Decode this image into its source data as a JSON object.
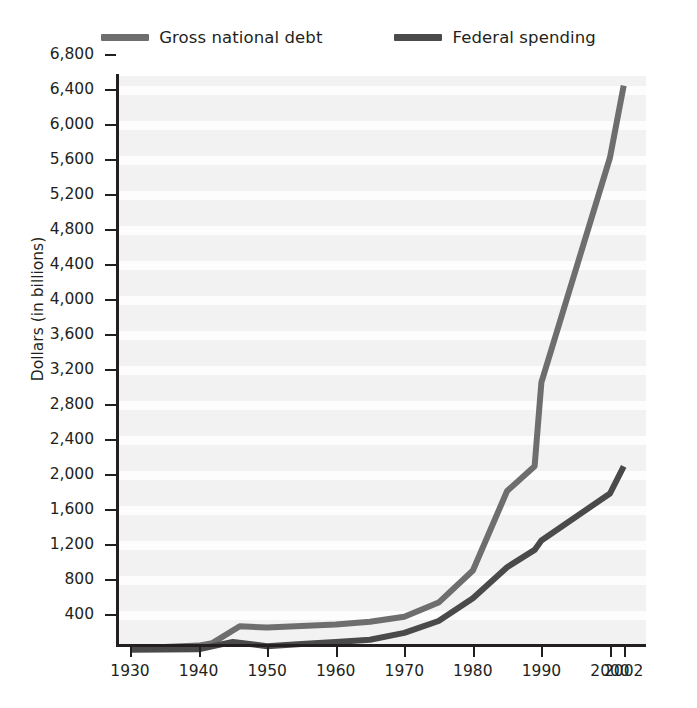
{
  "figure": {
    "background": "#ffffff",
    "plot_background": "#f2f2f2",
    "band_color": "#fdfdfd"
  },
  "legend": {
    "position": "top-center",
    "items": [
      {
        "label": "Gross national debt",
        "color": "#6e6e6e",
        "swatch": "line-swatch"
      },
      {
        "label": "Federal spending",
        "color": "#4a4a4a",
        "swatch": "line-swatch"
      }
    ]
  },
  "axes": {
    "ylabel": "Dollars (in billions)",
    "xlabel": "",
    "ytick_labels": [
      "6,800",
      "6,400",
      "6,000",
      "5,600",
      "5,200",
      "4,800",
      "4,400",
      "4,000",
      "3,600",
      "3,200",
      "2,800",
      "2,400",
      "2,000",
      "1,600",
      "1,200",
      "800",
      "400"
    ],
    "xtick_labels": [
      "1930",
      "1940",
      "1950",
      "1960",
      "1970",
      "1980",
      "1990",
      "2000",
      "2002"
    ]
  },
  "chart_data": {
    "type": "line",
    "title": "",
    "xlabel": "",
    "ylabel": "Dollars (in billions)",
    "xlim": [
      1930,
      2002
    ],
    "ylim": [
      0,
      6800
    ],
    "yticks": [
      400,
      800,
      1200,
      1600,
      2000,
      2400,
      2800,
      3200,
      3600,
      4000,
      4400,
      4800,
      5200,
      5600,
      6000,
      6400,
      6800
    ],
    "xticks": [
      1930,
      1940,
      1950,
      1960,
      1970,
      1980,
      1990,
      2000,
      2002
    ],
    "grid": "horizontal-bands",
    "legend_position": "top-center",
    "series": [
      {
        "name": "Gross national debt",
        "color": "#6e6e6e",
        "x": [
          1930,
          1940,
          1942,
          1946,
          1950,
          1955,
          1960,
          1965,
          1970,
          1975,
          1980,
          1985,
          1989,
          1990,
          2000,
          2002
        ],
        "values": [
          16,
          50,
          79,
          271,
          257,
          274,
          291,
          323,
          381,
          542,
          909,
          1817,
          2100,
          3060,
          5629,
          6450
        ]
      },
      {
        "name": "Federal spending",
        "color": "#4a4a4a",
        "x": [
          1930,
          1940,
          1945,
          1950,
          1955,
          1960,
          1965,
          1970,
          1975,
          1980,
          1985,
          1989,
          1990,
          2000,
          2002
        ],
        "values": [
          3,
          9,
          93,
          43,
          68,
          92,
          118,
          196,
          332,
          591,
          946,
          1144,
          1253,
          1789,
          2100
        ]
      }
    ]
  }
}
